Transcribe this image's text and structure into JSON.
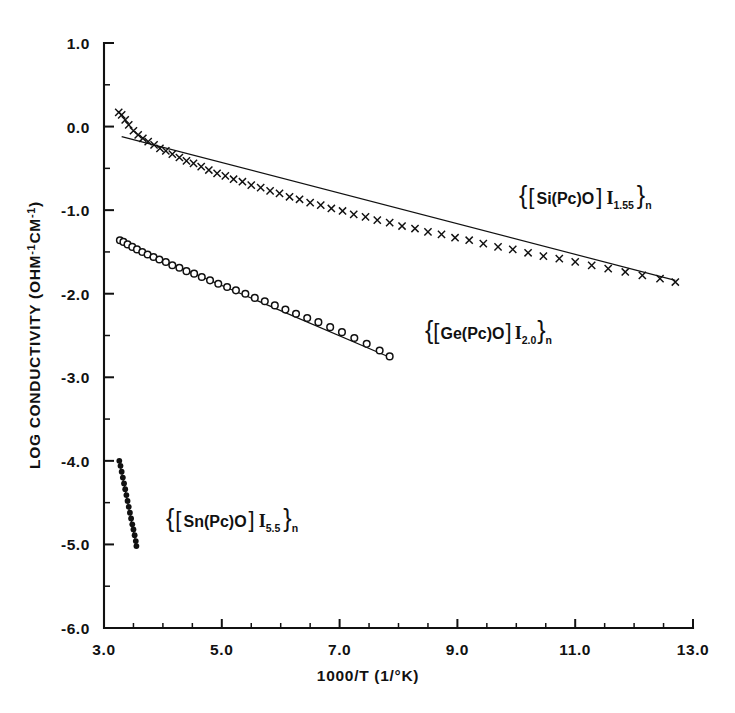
{
  "figure": {
    "name": "log-conductivity-arrhenius-plot",
    "background_color": "#ffffff",
    "ink_color": "#111111"
  },
  "axes": {
    "x_title": "1000/T (1/°K)",
    "y_title": "LOG CONDUCTIVITY (OHM⁻¹CM⁻¹)",
    "x_ticklabels": [
      "3.0",
      "5.0",
      "7.0",
      "9.0",
      "11.0",
      "13.0"
    ],
    "y_ticklabels": [
      "1.0",
      "0.0",
      "-1.0",
      "-2.0",
      "-3.0",
      "-4.0",
      "-5.0",
      "-6.0"
    ]
  },
  "labels": {
    "si": {
      "open_brace": "{",
      "open_bracket": "[",
      "formula": "Si(Pc)O",
      "close_bracket": "]",
      "iodine": "I",
      "stoich": "1.55",
      "close_brace": "}",
      "subscript_n": "n"
    },
    "ge": {
      "open_brace": "{",
      "open_bracket": "[",
      "formula": "Ge(Pc)O",
      "close_bracket": "]",
      "iodine": "I",
      "stoich": "2.0",
      "close_brace": "}",
      "subscript_n": "n"
    },
    "sn": {
      "open_brace": "{",
      "open_bracket": "[",
      "formula": "Sn(Pc)O",
      "close_bracket": "]",
      "iodine": "I",
      "stoich": "5.5",
      "close_brace": "}",
      "subscript_n": "n"
    }
  },
  "chart_data": {
    "type": "scatter",
    "title": "",
    "xlabel": "1000/T (1/°K)",
    "ylabel": "LOG CONDUCTIVITY (OHM⁻¹CM⁻¹)",
    "xlim": [
      3.0,
      13.0
    ],
    "ylim": [
      -6.0,
      1.0
    ],
    "xticks": [
      3.0,
      5.0,
      7.0,
      9.0,
      11.0,
      13.0
    ],
    "yticks": [
      1.0,
      0.0,
      -1.0,
      -2.0,
      -3.0,
      -4.0,
      -5.0,
      -6.0
    ],
    "x_minor_tick_step": 0.5,
    "y_minor_tick_step": 0.5,
    "grid": false,
    "legend": "inline-annotations",
    "series": [
      {
        "name": "{[Si(Pc)O] I1.55}n",
        "marker": "x",
        "fit_line": {
          "x": [
            3.3,
            12.7
          ],
          "y": [
            -0.12,
            -1.84
          ]
        },
        "x": [
          3.25,
          3.3,
          3.36,
          3.42,
          3.5,
          3.58,
          3.66,
          3.75,
          3.85,
          3.95,
          4.05,
          4.16,
          4.28,
          4.4,
          4.52,
          4.65,
          4.78,
          4.92,
          5.06,
          5.2,
          5.35,
          5.5,
          5.66,
          5.82,
          5.98,
          6.15,
          6.32,
          6.5,
          6.68,
          6.86,
          7.05,
          7.24,
          7.44,
          7.64,
          7.85,
          8.06,
          8.28,
          8.5,
          8.73,
          8.96,
          9.2,
          9.44,
          9.69,
          9.94,
          10.2,
          10.46,
          10.73,
          11.0,
          11.28,
          11.56,
          11.85,
          12.14,
          12.44,
          12.7
        ],
        "y": [
          0.17,
          0.14,
          0.08,
          0.02,
          -0.05,
          -0.1,
          -0.14,
          -0.18,
          -0.22,
          -0.26,
          -0.29,
          -0.33,
          -0.37,
          -0.41,
          -0.44,
          -0.48,
          -0.52,
          -0.56,
          -0.59,
          -0.63,
          -0.66,
          -0.7,
          -0.73,
          -0.77,
          -0.8,
          -0.84,
          -0.87,
          -0.91,
          -0.94,
          -0.98,
          -1.01,
          -1.05,
          -1.08,
          -1.12,
          -1.15,
          -1.19,
          -1.22,
          -1.26,
          -1.29,
          -1.33,
          -1.36,
          -1.4,
          -1.44,
          -1.47,
          -1.51,
          -1.55,
          -1.58,
          -1.62,
          -1.66,
          -1.7,
          -1.74,
          -1.78,
          -1.82,
          -1.86
        ]
      },
      {
        "name": "{[Ge(Pc)O] I2.0}n",
        "marker": "o",
        "fit_line": {
          "x": [
            3.27,
            7.85
          ],
          "y": [
            -1.38,
            -2.76
          ]
        },
        "x": [
          3.27,
          3.33,
          3.4,
          3.48,
          3.56,
          3.65,
          3.74,
          3.84,
          3.94,
          4.05,
          4.16,
          4.28,
          4.4,
          4.53,
          4.66,
          4.8,
          4.94,
          5.09,
          5.24,
          5.4,
          5.56,
          5.73,
          5.9,
          6.08,
          6.26,
          6.45,
          6.64,
          6.84,
          7.04,
          7.25,
          7.46,
          7.68,
          7.85
        ],
        "y": [
          -1.36,
          -1.38,
          -1.41,
          -1.44,
          -1.47,
          -1.5,
          -1.53,
          -1.56,
          -1.59,
          -1.62,
          -1.66,
          -1.69,
          -1.73,
          -1.76,
          -1.8,
          -1.84,
          -1.88,
          -1.92,
          -1.96,
          -2.0,
          -2.05,
          -2.09,
          -2.14,
          -2.19,
          -2.24,
          -2.29,
          -2.34,
          -2.4,
          -2.46,
          -2.53,
          -2.6,
          -2.68,
          -2.75
        ]
      },
      {
        "name": "{[Sn(Pc)O] I5.5}n",
        "marker": "dot",
        "fit_line": {
          "x": [
            3.26,
            3.55
          ],
          "y": [
            -4.0,
            -5.02
          ]
        },
        "x": [
          3.26,
          3.28,
          3.3,
          3.32,
          3.34,
          3.36,
          3.38,
          3.4,
          3.42,
          3.44,
          3.46,
          3.48,
          3.5,
          3.52,
          3.54,
          3.55
        ],
        "y": [
          -4.0,
          -4.06,
          -4.13,
          -4.2,
          -4.27,
          -4.34,
          -4.41,
          -4.48,
          -4.55,
          -4.62,
          -4.69,
          -4.76,
          -4.82,
          -4.89,
          -4.96,
          -5.02
        ]
      }
    ]
  }
}
